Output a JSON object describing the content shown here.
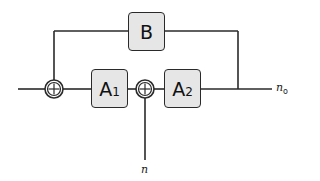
{
  "diagram": {
    "type": "block-diagram",
    "blocks": [
      {
        "id": "A1",
        "label": "A",
        "subscript": "1"
      },
      {
        "id": "A2",
        "label": "A",
        "subscript": "2"
      },
      {
        "id": "B",
        "label": "B",
        "subscript": ""
      }
    ],
    "summing_junctions": [
      {
        "id": "sum1",
        "symbol": "+",
        "inputs": [
          "input",
          "B"
        ],
        "output": "A1"
      },
      {
        "id": "sum2",
        "symbol": "+",
        "inputs": [
          "A1",
          "n"
        ],
        "output": "A2"
      }
    ],
    "signals": {
      "output_label": "n",
      "output_subscript": "o",
      "noise_label": "n"
    },
    "edges": [
      {
        "from": "input",
        "to": "sum1"
      },
      {
        "from": "sum1",
        "to": "A1"
      },
      {
        "from": "A1",
        "to": "sum2"
      },
      {
        "from": "n",
        "to": "sum2"
      },
      {
        "from": "sum2",
        "to": "A2"
      },
      {
        "from": "A2",
        "to": "n_o"
      },
      {
        "from": "A2_output_junction",
        "to": "B"
      },
      {
        "from": "B",
        "to": "sum1"
      }
    ],
    "colors": {
      "block_fill": "#e6e6e6",
      "stroke": "#2a2a2a"
    }
  }
}
